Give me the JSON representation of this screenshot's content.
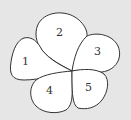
{
  "diagram": {
    "type": "five-petal region diagram",
    "background_color": "#e6e6e6",
    "fill_color": "#ffffff",
    "stroke_color": "#333333",
    "center_point": [
      72,
      71
    ],
    "petals": [
      {
        "id": 1,
        "label": "1"
      },
      {
        "id": 2,
        "label": "2"
      },
      {
        "id": 3,
        "label": "3"
      },
      {
        "id": 4,
        "label": "4"
      },
      {
        "id": 5,
        "label": "5"
      }
    ]
  }
}
